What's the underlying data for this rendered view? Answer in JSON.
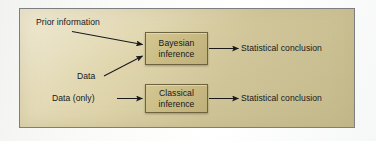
{
  "figure": {
    "kind": "flow-diagram",
    "panel_background": "#d6cb9e",
    "panel_border": "#7c7e80",
    "node_fill": "#c9bb83",
    "node_border": "#6d6340",
    "ink": "#17171a"
  },
  "nodes": {
    "bayesian": {
      "line1": "Bayesian",
      "line2": "inference"
    },
    "classical": {
      "line1": "Classical",
      "line2": "inference"
    }
  },
  "labels": {
    "prior_information": "Prior information",
    "data": "Data",
    "data_only": "Data (only)",
    "statistical_conclusion_1": "Statistical conclusion",
    "statistical_conclusion_2": "Statistical conclusion"
  },
  "arrows": [
    {
      "name": "prior-to-bayesian",
      "from": "Prior information",
      "to": "Bayesian inference",
      "style": "diagonal-down-right"
    },
    {
      "name": "data-to-bayesian",
      "from": "Data",
      "to": "Bayesian inference",
      "style": "diagonal-up-right"
    },
    {
      "name": "bayesian-to-conclusion",
      "from": "Bayesian inference",
      "to": "Statistical conclusion",
      "style": "horizontal-right"
    },
    {
      "name": "dataonly-to-classical",
      "from": "Data (only)",
      "to": "Classical inference",
      "style": "horizontal-right"
    },
    {
      "name": "classical-to-conclusion",
      "from": "Classical inference",
      "to": "Statistical conclusion",
      "style": "horizontal-right"
    }
  ]
}
